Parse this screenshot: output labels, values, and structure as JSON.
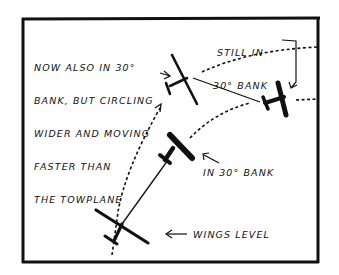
{
  "diagram": {
    "labels": {
      "glider_wide": [
        "NOW ALSO IN 30°",
        "BANK, BUT CIRCLING",
        "WIDER AND MOVING",
        "FASTER THAN",
        "THE TOWPLANE"
      ],
      "towplane_bank": [
        "STILL IN",
        "30° BANK"
      ],
      "glider_bank": "IN 30° BANK",
      "glider_level": "WINGS LEVEL"
    },
    "colors": {
      "ink": "#111111",
      "background": "#ffffff"
    }
  }
}
